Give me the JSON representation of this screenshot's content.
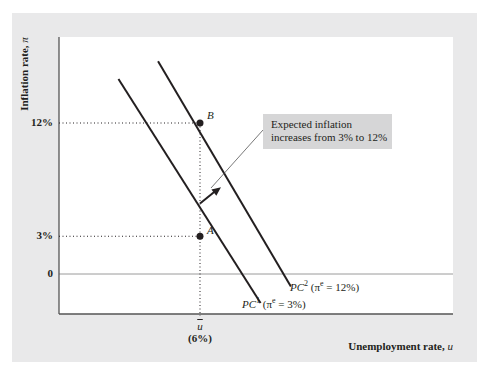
{
  "chart_data": {
    "type": "line",
    "title": "",
    "xlabel": "Unemployment rate, ",
    "xlabel_var": "u",
    "ylabel": "Inflation rate, ",
    "ylabel_var": "π",
    "y_ticks": [
      {
        "value": 12,
        "label": "12%"
      },
      {
        "value": 3,
        "label": "3%"
      },
      {
        "value": 0,
        "label": "0"
      }
    ],
    "x_ticks": [
      {
        "value": 6,
        "symbol": "u",
        "label": "(6%)"
      }
    ],
    "ylim": [
      -3.2,
      18.8
    ],
    "x_natural_rate": 6,
    "series": [
      {
        "name": "PC1",
        "label_main": "PC",
        "label_sup": "1",
        "label_rest": " (π",
        "label_e": "e",
        "label_end": " = 3%)",
        "expected_inflation": 3,
        "points": [
          {
            "u": 2.5,
            "pi": 15.5
          },
          {
            "u": 8.6,
            "pi": -2.3
          }
        ]
      },
      {
        "name": "PC2",
        "label_main": "PC",
        "label_sup": "2",
        "label_rest": " (π",
        "label_e": "e",
        "label_end": " = 12%)",
        "expected_inflation": 12,
        "points": [
          {
            "u": 4.2,
            "pi": 16.9
          },
          {
            "u": 9.9,
            "pi": -1.0
          }
        ]
      }
    ],
    "points": [
      {
        "name": "A",
        "u": 6,
        "pi": 3
      },
      {
        "name": "B",
        "u": 6,
        "pi": 12
      }
    ],
    "annotations": [
      {
        "text_line1": "Expected inflation",
        "text_line2": "increases from 3% to 12%"
      }
    ],
    "shift_arrow": {
      "from": {
        "u": 6.0,
        "pi": 5.6
      },
      "to": {
        "u": 6.9,
        "pi": 6.9
      }
    },
    "grid": false,
    "legend": "none"
  },
  "colors": {
    "panel": "#e9e9ea",
    "plot": "#ffffff",
    "line": "#231f20",
    "callout": "#d6d6d7",
    "zero_line": "#9a9a9a"
  }
}
